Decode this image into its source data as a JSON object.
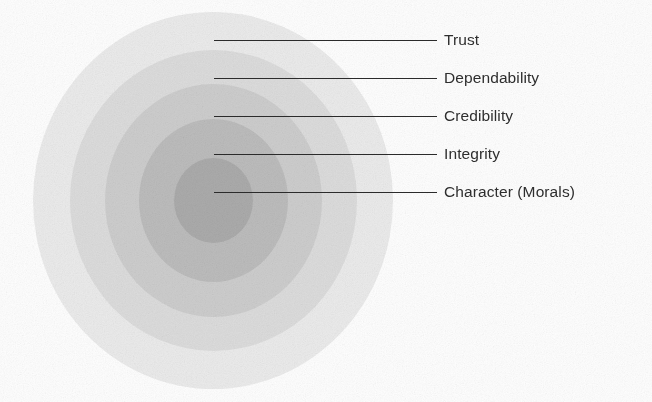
{
  "figure": {
    "type": "concentric-rings-diagram",
    "background_color": "#fefefe",
    "center": {
      "x": 213,
      "y": 200
    },
    "leader_line_color": "#2b2b2b",
    "label_color": "#2e2e2e"
  },
  "chart_data": {
    "type": "pie",
    "title": "",
    "subtitle": "",
    "xlabel": "",
    "ylabel": "",
    "legend_position": "right",
    "grid": false,
    "categories": [
      "Character (Morals)",
      "Integrity",
      "Credibility",
      "Dependability",
      "Trust"
    ],
    "values": [
      1,
      2,
      3,
      4,
      5
    ],
    "annotations": [
      "Character (Morals)",
      "Integrity",
      "Credibility",
      "Dependability",
      "Trust"
    ]
  },
  "rings": [
    {
      "id": "ring-trust",
      "label": "Trust",
      "level": 5,
      "fill": "#ebebeb",
      "left": 33,
      "top": 12,
      "width": 360,
      "height": 377
    },
    {
      "id": "ring-dependability",
      "label": "Dependability",
      "level": 4,
      "fill": "#dcdcdc",
      "left": 70,
      "top": 50,
      "width": 287,
      "height": 301
    },
    {
      "id": "ring-credibility",
      "label": "Credibility",
      "level": 3,
      "fill": "#cdcdcd",
      "left": 105,
      "top": 84,
      "width": 217,
      "height": 233
    },
    {
      "id": "ring-integrity",
      "label": "Integrity",
      "level": 2,
      "fill": "#bcbcbc",
      "left": 139,
      "top": 119,
      "width": 149,
      "height": 163
    },
    {
      "id": "ring-character",
      "label": "Character (Morals)",
      "level": 1,
      "fill": "#ababab",
      "left": 174,
      "top": 158,
      "width": 79,
      "height": 85
    }
  ],
  "callouts": [
    {
      "id": "callout-trust",
      "label": "Trust",
      "line_x": 214,
      "line_y": 40,
      "line_width": 223,
      "label_x": 444,
      "label_y": 32
    },
    {
      "id": "callout-dependability",
      "label": "Dependability",
      "line_x": 214,
      "line_y": 78,
      "line_width": 223,
      "label_x": 444,
      "label_y": 70
    },
    {
      "id": "callout-credibility",
      "label": "Credibility",
      "line_x": 214,
      "line_y": 116,
      "line_width": 223,
      "label_x": 444,
      "label_y": 108
    },
    {
      "id": "callout-integrity",
      "label": "Integrity",
      "line_x": 214,
      "line_y": 154,
      "line_width": 223,
      "label_x": 444,
      "label_y": 146
    },
    {
      "id": "callout-character",
      "label": "Character (Morals)",
      "line_x": 214,
      "line_y": 192,
      "line_width": 223,
      "label_x": 444,
      "label_y": 184
    }
  ]
}
